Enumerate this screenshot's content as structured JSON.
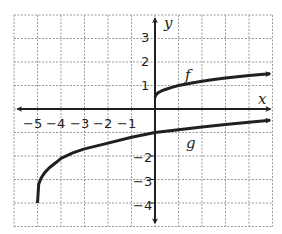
{
  "chart_data": {
    "type": "line",
    "title": "",
    "xlabel": "x",
    "ylabel": "y",
    "xlim": [
      -6,
      5
    ],
    "ylim": [
      -5,
      4
    ],
    "grid": true,
    "grid_style": "dashed",
    "x_tick_labels": [
      "-5",
      "-4",
      "-3",
      "-2",
      "-1"
    ],
    "y_tick_labels": [
      "3",
      "2",
      "1",
      "-2",
      "-3",
      "-4"
    ],
    "series": [
      {
        "name": "f",
        "label_position": [
          1.3,
          1.4
        ],
        "x": [
          0,
          0.05,
          0.15,
          0.3,
          0.5,
          0.75,
          1,
          1.5,
          2,
          2.5,
          3,
          3.5,
          4,
          4.5,
          4.9
        ],
        "y": [
          0.5,
          0.62,
          0.7,
          0.78,
          0.85,
          0.93,
          1.0,
          1.1,
          1.18,
          1.25,
          1.32,
          1.37,
          1.42,
          1.47,
          1.5
        ],
        "start": "closed endpoint at (0, 0.5)",
        "end": "arrow"
      },
      {
        "name": "g",
        "label_position": [
          1.4,
          -1.4
        ],
        "x": [
          -5,
          -4.95,
          -4.85,
          -4.7,
          -4.5,
          -4.2,
          -4,
          -3.5,
          -3,
          -2,
          -1,
          0,
          1,
          2,
          3,
          4,
          4.9
        ],
        "y": [
          -4,
          -3.2,
          -2.95,
          -2.72,
          -2.5,
          -2.27,
          -2.1,
          -1.87,
          -1.7,
          -1.45,
          -1.2,
          -1.0,
          -0.88,
          -0.76,
          -0.66,
          -0.56,
          -0.48
        ],
        "start": "closed endpoint at (-5, -4)",
        "end": "arrow"
      }
    ]
  },
  "labels": {
    "x_axis": "x",
    "y_axis": "y",
    "f": "f",
    "g": "g",
    "x_ticks": [
      "−5",
      "−4",
      "−3",
      "−2",
      "−1"
    ],
    "y_ticks": [
      "3",
      "2",
      "1",
      "−2",
      "−3",
      "−4"
    ]
  },
  "colors": {
    "curve": "#231f20",
    "axis": "#231f20",
    "grid": "#9a9a9a",
    "background": "#ffffff"
  }
}
